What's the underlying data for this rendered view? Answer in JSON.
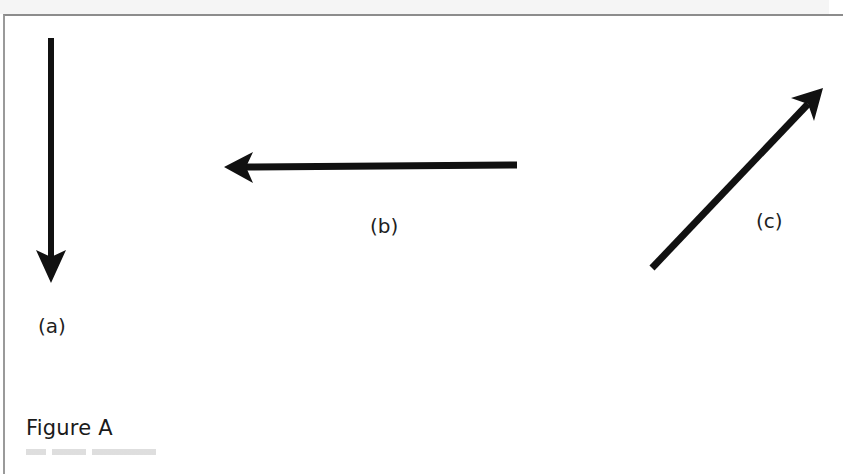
{
  "figure": {
    "title": "Figure A",
    "border_color": "#8c8c8c",
    "arrow_color": "#111111",
    "arrows": [
      {
        "id": "a",
        "label": "(a)",
        "direction": "down",
        "from": [
          51,
          38
        ],
        "to": [
          51,
          283
        ]
      },
      {
        "id": "b",
        "label": "(b)",
        "direction": "left",
        "from": [
          517,
          165
        ],
        "to": [
          224,
          167
        ]
      },
      {
        "id": "c",
        "label": "(c)",
        "direction": "up-right",
        "from": [
          652,
          268
        ],
        "to": [
          823,
          88
        ]
      }
    ]
  }
}
